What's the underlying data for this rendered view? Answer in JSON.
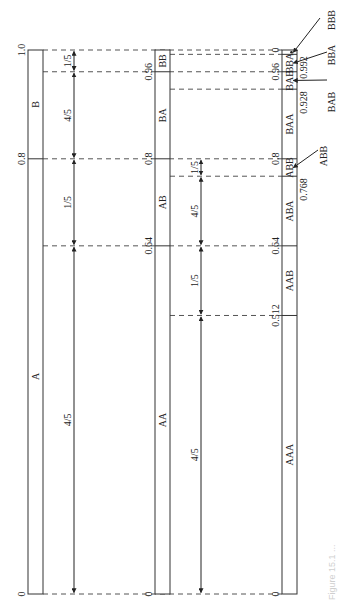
{
  "diagram": {
    "type": "arithmetic-coding-interval-subdivision",
    "orientation": "rotated-90",
    "scale": {
      "y_zero": 594,
      "y_one": 50
    },
    "columns": [
      {
        "id": "col1",
        "bar_x": 28,
        "bar_w": 15,
        "segments": [
          {
            "label": "A",
            "low": 0,
            "high": 0.8
          },
          {
            "label": "B",
            "low": 0.8,
            "high": 1.0
          }
        ],
        "tick_labels": [
          {
            "text": "0",
            "value": 0
          },
          {
            "text": "0.8",
            "value": 0.8
          },
          {
            "text": "1.0",
            "value": 1.0
          }
        ],
        "dimension_x": 74,
        "dimensions": [
          {
            "label": "4/5",
            "low": 0,
            "high": 0.64
          },
          {
            "label": "1/5",
            "low": 0.64,
            "high": 0.8
          },
          {
            "label": "4/5",
            "low": 0.8,
            "high": 0.96
          },
          {
            "label": "1/5",
            "low": 0.96,
            "high": 1.0
          }
        ]
      },
      {
        "id": "col2",
        "bar_x": 155,
        "bar_w": 15,
        "segments": [
          {
            "label": "AA",
            "low": 0,
            "high": 0.64
          },
          {
            "label": "AB",
            "low": 0.64,
            "high": 0.8
          },
          {
            "label": "BA",
            "low": 0.8,
            "high": 0.96
          },
          {
            "label": "BB",
            "low": 0.96,
            "high": 1.0
          }
        ],
        "tick_labels": [
          {
            "text": "0",
            "value": 0
          },
          {
            "text": "0.64",
            "value": 0.64
          },
          {
            "text": "0.8",
            "value": 0.8
          },
          {
            "text": "0.96",
            "value": 0.96
          }
        ],
        "dimension_x": 201,
        "dimensions": [
          {
            "label": "4/5",
            "low": 0,
            "high": 0.512
          },
          {
            "label": "1/5",
            "low": 0.512,
            "high": 0.64
          },
          {
            "label": "4/5",
            "low": 0.64,
            "high": 0.768
          },
          {
            "label": "1/5",
            "low": 0.768,
            "high": 0.8
          }
        ]
      },
      {
        "id": "col3",
        "bar_x": 282,
        "bar_w": 15,
        "segments": [
          {
            "label": "AAA",
            "low": 0,
            "high": 0.512
          },
          {
            "label": "AAB",
            "low": 0.512,
            "high": 0.64
          },
          {
            "label": "ABA",
            "low": 0.64,
            "high": 0.768
          },
          {
            "label": "ABB",
            "low": 0.768,
            "high": 0.8
          },
          {
            "label": "BAA",
            "low": 0.8,
            "high": 0.928
          },
          {
            "label": "BAB",
            "low": 0.928,
            "high": 0.96
          },
          {
            "label": "BBA",
            "low": 0.96,
            "high": 0.992
          },
          {
            "label": "BBB",
            "low": 0.992,
            "high": 1.0
          }
        ],
        "tick_labels_left": [
          {
            "text": "0",
            "value": 0
          },
          {
            "text": "0.512",
            "value": 0.512
          },
          {
            "text": "0.64",
            "value": 0.64
          },
          {
            "text": "0.8",
            "value": 0.8
          },
          {
            "text": "0.96",
            "value": 0.96
          },
          {
            "text": "0",
            "value": 1.0
          }
        ],
        "tick_labels_right": [
          {
            "text": "0.768",
            "value": 0.768
          },
          {
            "text": "0.928",
            "value": 0.928
          },
          {
            "text": "0.992",
            "value": 0.992
          }
        ],
        "callouts": [
          {
            "label": "BBB",
            "value": 0.996
          },
          {
            "label": "BBA",
            "value": 0.976
          },
          {
            "label": "BAB",
            "value": 0.944
          },
          {
            "label": "ABB",
            "value": 0.784
          }
        ]
      }
    ],
    "dashed_guides": [
      1.0,
      0.992,
      0.96,
      0.928,
      0.8,
      0.768,
      0.64,
      0.512,
      0
    ],
    "caption_fragment": "Figure 15.1 ..."
  }
}
